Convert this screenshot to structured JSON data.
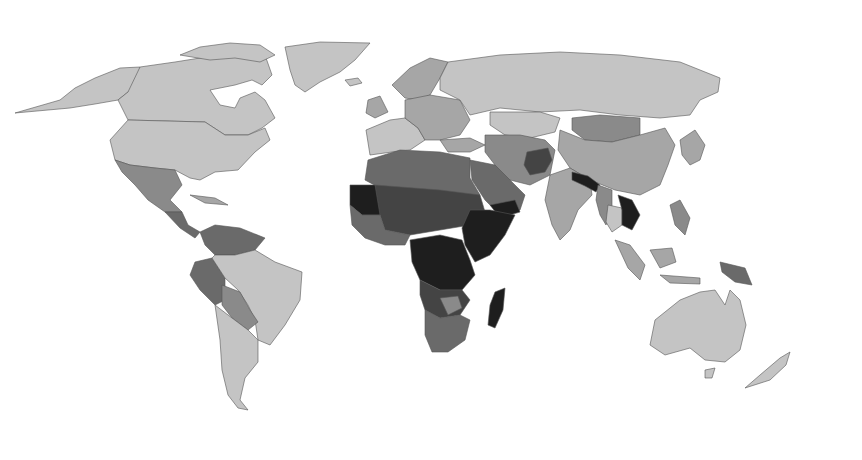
{
  "map": {
    "type": "choropleth",
    "projection": "robinson-like",
    "color_scale": "grayscale",
    "legend": null,
    "title": null,
    "shades": {
      "level_1": "#c4c4c4",
      "level_2": "#a6a6a6",
      "level_3": "#8a8a8a",
      "level_4": "#6a6a6a",
      "level_5": "#444444",
      "level_6": "#1e1e1e",
      "ocean": "#ffffff"
    },
    "regions": [
      {
        "name": "Canada / USA / Greenland / Alaska",
        "level": "level_1"
      },
      {
        "name": "Mexico / Central America",
        "level": "level_3"
      },
      {
        "name": "Brazil / Argentina / Chile",
        "level": "level_1"
      },
      {
        "name": "Peru / Bolivia / Paraguay / Venezuela",
        "level": "level_3"
      },
      {
        "name": "Western Europe",
        "level": "level_1"
      },
      {
        "name": "Eastern Europe",
        "level": "level_2"
      },
      {
        "name": "Russia",
        "level": "level_1"
      },
      {
        "name": "Kazakhstan",
        "level": "level_1"
      },
      {
        "name": "Mongolia",
        "level": "level_3"
      },
      {
        "name": "China",
        "level": "level_2"
      },
      {
        "name": "India",
        "level": "level_2"
      },
      {
        "name": "Afghanistan",
        "level": "level_5"
      },
      {
        "name": "Pakistan / Iran / Central Asia",
        "level": "level_3"
      },
      {
        "name": "Arabian Peninsula",
        "level": "level_4"
      },
      {
        "name": "Yemen",
        "level": "level_6"
      },
      {
        "name": "Nepal / Bangladesh",
        "level": "level_6"
      },
      {
        "name": "Myanmar",
        "level": "level_3"
      },
      {
        "name": "Laos / Cambodia",
        "level": "level_6"
      },
      {
        "name": "North Africa",
        "level": "level_4"
      },
      {
        "name": "Sahel / West Africa",
        "level": "level_5"
      },
      {
        "name": "Mauritania / Mali",
        "level": "level_6"
      },
      {
        "name": "Horn of Africa",
        "level": "level_6"
      },
      {
        "name": "Central Africa",
        "level": "level_6"
      },
      {
        "name": "Southern Africa",
        "level": "level_4"
      },
      {
        "name": "Madagascar",
        "level": "level_6"
      },
      {
        "name": "Japan / Korea",
        "level": "level_2"
      },
      {
        "name": "Indonesia / Philippines",
        "level": "level_2"
      },
      {
        "name": "Papua New Guinea",
        "level": "level_4"
      },
      {
        "name": "Australia / New Zealand",
        "level": "level_1"
      }
    ]
  }
}
